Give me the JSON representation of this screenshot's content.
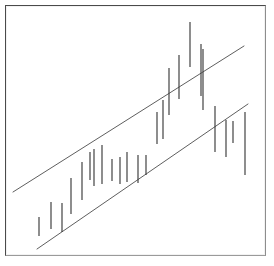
{
  "figure": {
    "title": "",
    "width": 274,
    "height": 266,
    "background_color": "#ffffff",
    "frame": {
      "border_color": "#4a4a4a",
      "x": 5,
      "y": 5,
      "width": 261,
      "height": 251
    }
  },
  "chart_data": {
    "type": "bar",
    "variant": "vertical-range-bars-with-trend-channel",
    "title": "",
    "subtitle": "",
    "xlabel": "",
    "ylabel": "",
    "xlim": [
      0,
      274
    ],
    "ylim": [
      266,
      0
    ],
    "grid": false,
    "legend": null,
    "axis_ticks": {
      "x": [],
      "y": []
    },
    "bar_color": "#3a3a3a",
    "bar_width": 1.15,
    "categories": [
      "1",
      "2",
      "3",
      "4",
      "5",
      "6",
      "7",
      "8",
      "9",
      "10",
      "11",
      "12",
      "13",
      "14",
      "15",
      "16",
      "17",
      "18",
      "19",
      "20",
      "21",
      "22",
      "23",
      "24"
    ],
    "bars": [
      {
        "index": 1,
        "x": 39,
        "high": 217,
        "low": 236
      },
      {
        "index": 2,
        "x": 51,
        "high": 202,
        "low": 229
      },
      {
        "index": 3,
        "x": 62,
        "high": 203,
        "low": 232
      },
      {
        "index": 4,
        "x": 71,
        "high": 178,
        "low": 214
      },
      {
        "index": 5,
        "x": 82,
        "high": 162,
        "low": 200
      },
      {
        "index": 6,
        "x": 90,
        "high": 152,
        "low": 180
      },
      {
        "index": 7,
        "x": 94,
        "high": 149,
        "low": 186
      },
      {
        "index": 8,
        "x": 102,
        "high": 145,
        "low": 184
      },
      {
        "index": 9,
        "x": 112,
        "high": 159,
        "low": 181
      },
      {
        "index": 10,
        "x": 120,
        "high": 157,
        "low": 184
      },
      {
        "index": 11,
        "x": 127,
        "high": 152,
        "low": 182
      },
      {
        "index": 12,
        "x": 138,
        "high": 155,
        "low": 183
      },
      {
        "index": 13,
        "x": 146,
        "high": 155,
        "low": 175
      },
      {
        "index": 14,
        "x": 157,
        "high": 112,
        "low": 144
      },
      {
        "index": 15,
        "x": 163,
        "high": 100,
        "low": 139
      },
      {
        "index": 16,
        "x": 169,
        "high": 68,
        "low": 115
      },
      {
        "index": 17,
        "x": 179,
        "high": 55,
        "low": 99
      },
      {
        "index": 18,
        "x": 190,
        "high": 22,
        "low": 67
      },
      {
        "index": 19,
        "x": 201,
        "high": 44,
        "low": 96
      },
      {
        "index": 20,
        "x": 203,
        "high": 49,
        "low": 110
      },
      {
        "index": 21,
        "x": 215,
        "high": 106,
        "low": 152
      },
      {
        "index": 22,
        "x": 226,
        "high": 120,
        "low": 157
      },
      {
        "index": 23,
        "x": 233,
        "high": 121,
        "low": 143
      },
      {
        "index": 24,
        "x": 245,
        "high": 112,
        "low": 175
      }
    ],
    "trend_channel": {
      "color": "#4c4c4c",
      "line_width": 0.9,
      "upper_line": {
        "x1": 13,
        "y1": 192,
        "x2": 244,
        "y2": 46
      },
      "lower_line": {
        "x1": 37,
        "y1": 249,
        "x2": 248,
        "y2": 104
      }
    }
  }
}
